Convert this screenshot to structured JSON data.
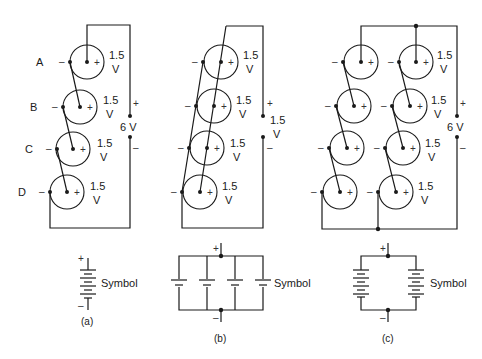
{
  "figure": {
    "panels": [
      {
        "id": "a",
        "caption": "(a)",
        "connection": "series",
        "cell_labels": [
          "A",
          "B",
          "C",
          "D"
        ],
        "cell_voltage_value": "1.5",
        "cell_voltage_unit": "V",
        "total_voltage": "6 V",
        "symbol_label": "Symbol"
      },
      {
        "id": "b",
        "caption": "(b)",
        "connection": "parallel",
        "cell_voltage_value": "1.5",
        "cell_voltage_unit": "V",
        "total_voltage_value": "1.5",
        "total_voltage_unit": "V",
        "symbol_label": "Symbol"
      },
      {
        "id": "c",
        "caption": "(c)",
        "connection": "series-parallel",
        "cell_voltage_value": "1.5",
        "cell_voltage_unit": "V",
        "total_voltage": "6 V",
        "symbol_label": "Symbol"
      }
    ],
    "polarity": {
      "plus": "+",
      "minus": "–"
    }
  }
}
